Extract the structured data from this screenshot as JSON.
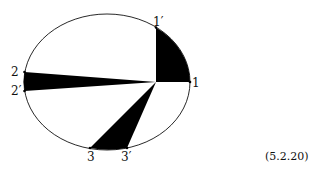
{
  "diagram": {
    "ellipse": {
      "cx": 107,
      "cy": 82,
      "rx": 83,
      "ry": 68
    },
    "center": {
      "x": 156,
      "y": 82
    },
    "labels": {
      "p1": "1",
      "p1prime": "1′",
      "p2": "2",
      "p2prime": "2′",
      "p3": "3",
      "p3prime": "3′"
    },
    "equation_number": "(5.2.20)",
    "colors": {
      "fill": "#000000",
      "stroke": "#111111",
      "background": "#ffffff"
    }
  }
}
